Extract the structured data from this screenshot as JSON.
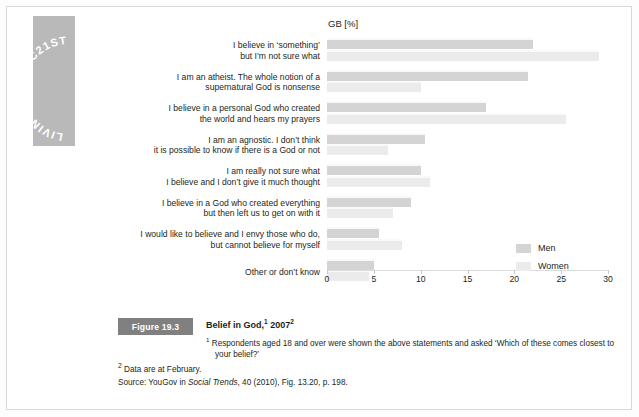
{
  "sidebar": {
    "label": "LIVING IN THE C21ST"
  },
  "chart_header": {
    "units": "GB [%]"
  },
  "legend": {
    "items": [
      {
        "name": "Men",
        "color": "#d4d4d4"
      },
      {
        "name": "Women",
        "color": "#ebebeb"
      }
    ]
  },
  "axis": {
    "ticks": [
      "0",
      "5",
      "10",
      "15",
      "20",
      "25",
      "30"
    ]
  },
  "caption": {
    "figure_badge": "Figure 19.3",
    "title_main": "Belief in God,",
    "title_sup1": "1",
    "title_year": " 2007",
    "title_sup2": "2",
    "footnote1_sup": "1",
    "footnote1": "Respondents aged 18 and over were shown the above statements and asked ‘Which of these comes closest to your belief?’",
    "footnote2_sup": "2",
    "footnote2": "Data are at February.",
    "source_prefix": "Source: YouGov in ",
    "source_italic": "Social Trends",
    "source_suffix": ", 40 (2010), Fig. 13.20, p. 198."
  },
  "chart_data": {
    "type": "bar",
    "orientation": "horizontal",
    "xlabel": "GB [%]",
    "ylabel": "",
    "xlim": [
      0,
      30
    ],
    "xticks": [
      0,
      5,
      10,
      15,
      20,
      25,
      30
    ],
    "grid": false,
    "legend_position": "right-bottom",
    "categories": [
      "I believe in ‘something’ but I’m not sure what",
      "I am an atheist. The whole notion of a supernatural God is nonsense",
      "I believe in a personal God who created the world and hears my prayers",
      "I am an agnostic. I don’t think it is possible to know if there is a God or not",
      "I am really not sure what I believe and I don’t give it much thought",
      "I believe in a God who created everything but then left us to get on with it",
      "I would like to believe and I envy those who do, but cannot believe for myself",
      "Other or don’t know"
    ],
    "categories_lines": [
      [
        "I believe in ‘something’",
        "but I’m not sure what"
      ],
      [
        "I am an atheist. The whole notion of a",
        "supernatural God is nonsense"
      ],
      [
        "I believe in a personal God who created",
        "the world and hears my prayers"
      ],
      [
        "I am an agnostic. I don’t think",
        "it is possible to know if there is a God or not"
      ],
      [
        "I am really not sure what",
        "I believe and I don’t give it much thought"
      ],
      [
        "I believe in a God who created everything",
        "but then left us to get on with it"
      ],
      [
        "I would like to believe and I envy those who do,",
        "but cannot believe for myself"
      ],
      [
        "Other or don’t know"
      ]
    ],
    "series": [
      {
        "name": "Men",
        "color": "#d4d4d4",
        "values": [
          22.0,
          21.5,
          17.0,
          10.5,
          10.0,
          9.0,
          5.5,
          5.0
        ]
      },
      {
        "name": "Women",
        "color": "#ebebeb",
        "values": [
          29.0,
          10.0,
          25.5,
          6.5,
          11.0,
          7.0,
          8.0,
          4.5
        ]
      }
    ]
  }
}
